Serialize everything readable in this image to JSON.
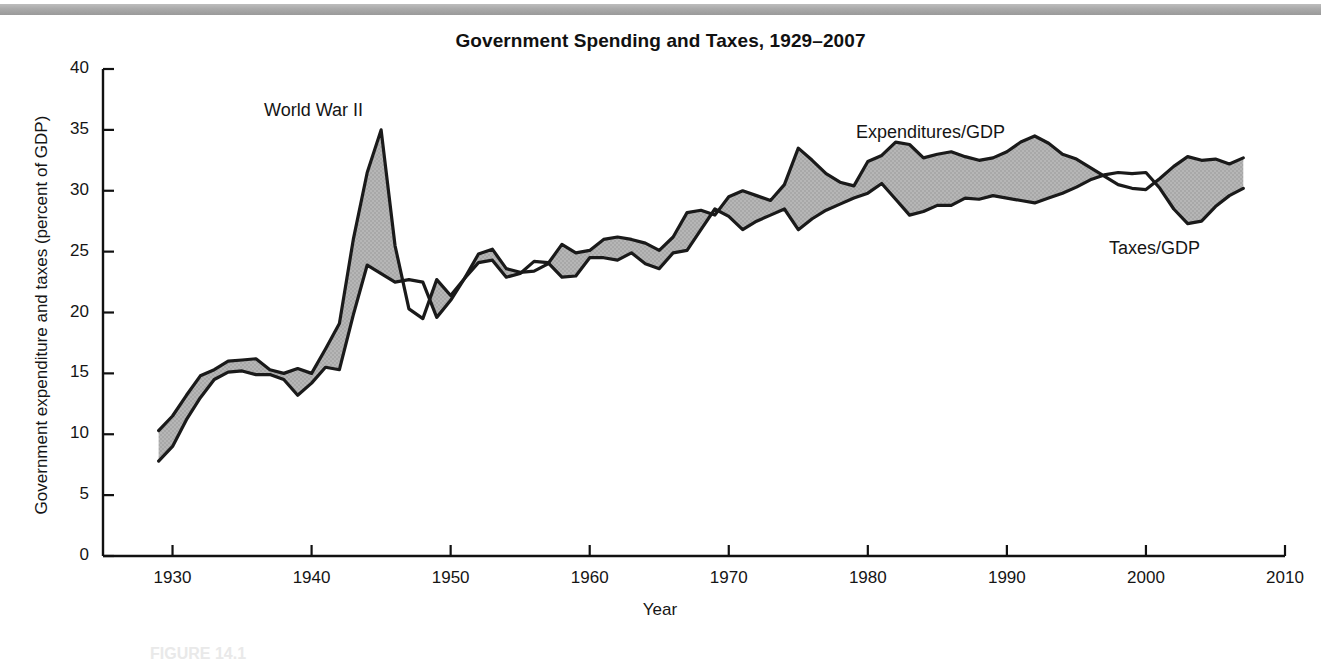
{
  "figure": {
    "title": "Government Spending and Taxes, 1929–2007",
    "caption": "FIGURE 14.1",
    "top_rule_color": "#a9a9a9"
  },
  "annotations": [
    {
      "name": "world-war-2-label",
      "text": "World War II",
      "x_px": 264,
      "y_px": 100
    },
    {
      "name": "expenditures-label",
      "text": "Expenditures/GDP",
      "x_px": 856,
      "y_px": 122
    },
    {
      "name": "taxes-label",
      "text": "Taxes/GDP",
      "x_px": 1109,
      "y_px": 238
    }
  ],
  "chart_data": {
    "type": "line",
    "title": "Government Spending and Taxes, 1929–2007",
    "xlabel": "Year",
    "ylabel": "Government expenditure and taxes (percent of GDP)",
    "xlim": [
      1925,
      2010
    ],
    "ylim": [
      0,
      40
    ],
    "xticks": [
      1930,
      1940,
      1950,
      1960,
      1970,
      1980,
      1990,
      2000,
      2010
    ],
    "yticks": [
      0,
      5,
      10,
      15,
      20,
      25,
      30,
      35,
      40
    ],
    "grid": false,
    "legend_position": "inline-annotations",
    "shade_color": "#a8a8a8",
    "line_color": "#1a1a1a",
    "shade_meaning": "Shaded area = expenditures exceed taxes (deficit)",
    "x": [
      1929,
      1930,
      1931,
      1932,
      1933,
      1934,
      1935,
      1936,
      1937,
      1938,
      1939,
      1940,
      1941,
      1942,
      1943,
      1944,
      1945,
      1946,
      1947,
      1948,
      1949,
      1950,
      1951,
      1952,
      1953,
      1954,
      1955,
      1956,
      1957,
      1958,
      1959,
      1960,
      1961,
      1962,
      1963,
      1964,
      1965,
      1966,
      1967,
      1968,
      1969,
      1970,
      1971,
      1972,
      1973,
      1974,
      1975,
      1976,
      1977,
      1978,
      1979,
      1980,
      1981,
      1982,
      1983,
      1984,
      1985,
      1986,
      1987,
      1988,
      1989,
      1990,
      1991,
      1992,
      1993,
      1994,
      1995,
      1996,
      1997,
      1998,
      1999,
      2000,
      2001,
      2002,
      2003,
      2004,
      2005,
      2006,
      2007
    ],
    "series": [
      {
        "name": "Expenditures/GDP",
        "values": [
          10.3,
          11.5,
          13.2,
          14.8,
          15.3,
          16.0,
          16.1,
          16.2,
          15.3,
          15.0,
          15.4,
          15.0,
          17.0,
          19.1,
          26.0,
          31.5,
          35.0,
          25.5,
          20.3,
          19.5,
          22.7,
          21.4,
          22.8,
          24.8,
          25.2,
          23.6,
          23.3,
          23.4,
          24.0,
          25.6,
          24.9,
          25.1,
          26.0,
          26.2,
          26.0,
          25.7,
          25.1,
          26.2,
          28.2,
          28.4,
          28.0,
          29.5,
          30.0,
          29.6,
          29.2,
          30.5,
          33.5,
          32.5,
          31.4,
          30.7,
          30.4,
          32.4,
          32.9,
          34.0,
          33.8,
          32.7,
          33.0,
          33.2,
          32.8,
          32.5,
          32.7,
          33.2,
          34.0,
          34.5,
          33.9,
          33.0,
          32.6,
          31.9,
          31.2,
          30.5,
          30.2,
          30.1,
          31.0,
          32.0,
          32.8,
          32.5,
          32.6,
          32.2,
          32.7
        ]
      },
      {
        "name": "Taxes/GDP",
        "values": [
          7.8,
          9.0,
          11.2,
          13.0,
          14.5,
          15.1,
          15.2,
          14.9,
          14.9,
          14.5,
          13.2,
          14.2,
          15.5,
          15.3,
          19.8,
          23.9,
          23.2,
          22.5,
          22.7,
          22.5,
          19.6,
          21.0,
          22.8,
          24.1,
          24.3,
          22.9,
          23.2,
          24.2,
          24.1,
          22.9,
          23.0,
          24.5,
          24.5,
          24.3,
          24.9,
          24.0,
          23.6,
          24.9,
          25.1,
          26.8,
          28.5,
          27.9,
          26.8,
          27.5,
          28.0,
          28.5,
          26.8,
          27.7,
          28.4,
          28.9,
          29.4,
          29.8,
          30.6,
          29.3,
          28.0,
          28.3,
          28.8,
          28.8,
          29.4,
          29.3,
          29.6,
          29.4,
          29.2,
          29.0,
          29.4,
          29.8,
          30.3,
          30.9,
          31.3,
          31.5,
          31.4,
          31.5,
          30.2,
          28.5,
          27.3,
          27.5,
          28.7,
          29.6,
          30.2
        ]
      }
    ]
  }
}
